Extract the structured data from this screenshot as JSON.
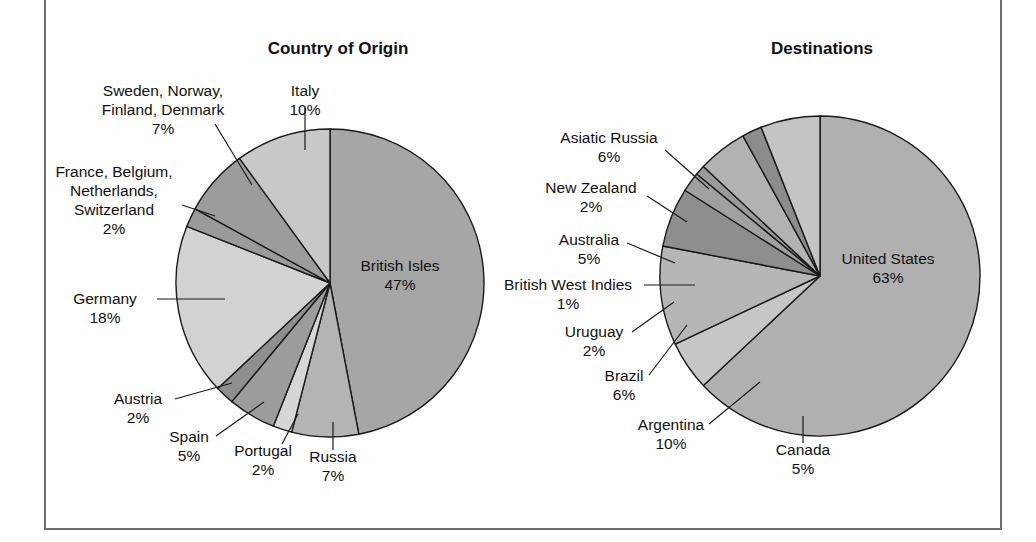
{
  "figure": {
    "background": "#ffffff",
    "frame_color": "#6e6e6e"
  },
  "charts": [
    {
      "id": "country-of-origin",
      "title": "Country of Origin",
      "title_x": 338,
      "title_y": 54,
      "cx": 330,
      "cy": 283,
      "r": 154
    },
    {
      "id": "destinations",
      "title": "Destinations",
      "title_x": 822,
      "title_y": 54,
      "cx": 820,
      "cy": 276,
      "r": 160
    }
  ],
  "chart_data": [
    {
      "type": "pie",
      "title": "Country of Origin",
      "xlabel": "",
      "ylabel": "",
      "legend": "none",
      "units": "percent",
      "start_angle_deg": 0,
      "direction": "clockwise",
      "categories": [
        "British Isles",
        "Russia",
        "Portugal",
        "Spain",
        "Austria",
        "Germany",
        "France, Belgium, Netherlands, Switzerland",
        "Sweden, Norway, Finland, Denmark",
        "Italy"
      ],
      "values": [
        47,
        7,
        2,
        5,
        2,
        18,
        2,
        7,
        10
      ],
      "value_labels": [
        "47%",
        "7%",
        "2%",
        "5%",
        "2%",
        "18%",
        "2%",
        "7%",
        "10%"
      ],
      "colors": [
        "#a6a6a6",
        "#b4b4b4",
        "#d6d6d6",
        "#9c9c9c",
        "#8f8f8f",
        "#d2d2d2",
        "#9a9a9a",
        "#9c9c9c",
        "#c8c8c8"
      ]
    },
    {
      "type": "pie",
      "title": "Destinations",
      "xlabel": "",
      "ylabel": "",
      "legend": "none",
      "units": "percent",
      "start_angle_deg": 0,
      "direction": "clockwise",
      "categories": [
        "United States",
        "Canada",
        "Argentina",
        "Brazil",
        "Uruguay",
        "British West Indies",
        "Australia",
        "New Zealand",
        "Asiatic Russia"
      ],
      "values": [
        63,
        5,
        10,
        6,
        2,
        1,
        5,
        2,
        6
      ],
      "value_labels": [
        "63%",
        "5%",
        "10%",
        "6%",
        "2%",
        "1%",
        "5%",
        "2%",
        "6%"
      ],
      "colors": [
        "#b0b0b0",
        "#c6c6c6",
        "#b6b6b6",
        "#8e8e8e",
        "#a0a0a0",
        "#9a9a9a",
        "#b2b2b2",
        "#8c8c8c",
        "#c4c4c4"
      ]
    }
  ],
  "origin_labels": [
    {
      "name": "sweden-norway-finland-denmark",
      "lines": [
        "Sweden, Norway,",
        "Finland, Denmark",
        "7%"
      ],
      "x": 163,
      "y": 96,
      "anchor": "middle",
      "line_height": 19,
      "leader": "M 215 124 L 252 185"
    },
    {
      "name": "italy",
      "lines": [
        "Italy",
        "10%"
      ],
      "x": 305,
      "y": 96,
      "anchor": "middle",
      "line_height": 19,
      "leader": "M 305 108 L 305 150"
    },
    {
      "name": "france-belgium-netherlands-switzerland",
      "lines": [
        "France, Belgium,",
        "Netherlands,",
        "Switzerland",
        "2%"
      ],
      "x": 114,
      "y": 177,
      "anchor": "middle",
      "line_height": 19,
      "leader": "M 182 205 L 215 216"
    },
    {
      "name": "germany",
      "lines": [
        "Germany",
        "18%"
      ],
      "x": 105,
      "y": 304,
      "anchor": "middle",
      "line_height": 19,
      "leader": "M 157 299 L 225 299"
    },
    {
      "name": "austria",
      "lines": [
        "Austria",
        "2%"
      ],
      "x": 138,
      "y": 404,
      "anchor": "middle",
      "line_height": 19,
      "leader": "M 175 399 L 232 383"
    },
    {
      "name": "spain",
      "lines": [
        "Spain",
        "5%"
      ],
      "x": 189,
      "y": 442,
      "anchor": "middle",
      "line_height": 19,
      "leader": "M 216 436 L 264 402"
    },
    {
      "name": "portugal",
      "lines": [
        "Portugal",
        "2%"
      ],
      "x": 263,
      "y": 456,
      "anchor": "middle",
      "line_height": 19,
      "leader": "M 282 444 L 298 414"
    },
    {
      "name": "russia",
      "lines": [
        "Russia",
        "7%"
      ],
      "x": 333,
      "y": 462,
      "anchor": "middle",
      "line_height": 19,
      "leader": "M 333 450 L 333 422"
    },
    {
      "name": "british-isles",
      "lines": [
        "British Isles",
        "47%"
      ],
      "x": 400,
      "y": 271,
      "anchor": "middle",
      "line_height": 19,
      "leader": ""
    }
  ],
  "destination_labels": [
    {
      "name": "asiatic-russia",
      "lines": [
        "Asiatic Russia",
        "6%"
      ],
      "x": 609,
      "y": 143,
      "anchor": "middle",
      "line_height": 19,
      "line_y_offsets": [
        0,
        19
      ],
      "leader": "M 665 150 L 709 189"
    },
    {
      "name": "new-zealand",
      "lines": [
        "New Zealand",
        "2%"
      ],
      "x": 591,
      "y": 193,
      "anchor": "middle",
      "line_height": 19,
      "leader": "M 647 196 L 687 222"
    },
    {
      "name": "australia",
      "lines": [
        "Australia",
        "5%"
      ],
      "x": 589,
      "y": 245,
      "anchor": "middle",
      "line_height": 19,
      "leader": "M 627 243 L 675 263"
    },
    {
      "name": "british-west-indies",
      "lines": [
        "British West Indies",
        "1%"
      ],
      "x": 568,
      "y": 290,
      "anchor": "middle",
      "line_height": 19,
      "leader": "M 644 285 L 695 285"
    },
    {
      "name": "uruguay",
      "lines": [
        "Uruguay",
        "2%"
      ],
      "x": 594,
      "y": 337,
      "anchor": "middle",
      "line_height": 19,
      "leader": "M 632 332 L 674 302"
    },
    {
      "name": "brazil",
      "lines": [
        "Brazil",
        "6%"
      ],
      "x": 624,
      "y": 381,
      "anchor": "middle",
      "line_height": 19,
      "leader": "M 649 375 L 687 325"
    },
    {
      "name": "argentina",
      "lines": [
        "Argentina",
        "10%"
      ],
      "x": 671,
      "y": 430,
      "anchor": "middle",
      "line_height": 19,
      "leader": "M 709 424 L 760 382"
    },
    {
      "name": "canada",
      "lines": [
        "Canada",
        "5%"
      ],
      "x": 803,
      "y": 455,
      "anchor": "middle",
      "line_height": 19,
      "leader": "M 803 443 L 803 416"
    },
    {
      "name": "united-states",
      "lines": [
        "United States",
        "63%"
      ],
      "x": 888,
      "y": 264,
      "anchor": "middle",
      "line_height": 19,
      "leader": ""
    }
  ]
}
